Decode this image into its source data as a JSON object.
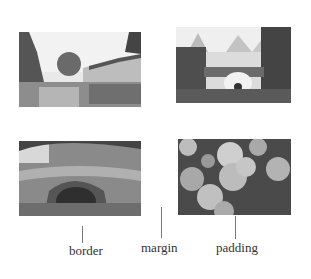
{
  "photos": [
    {
      "name": "village-river-photo",
      "subject": "riverside village houses with tree reflection"
    },
    {
      "name": "stone-bridge-karst-photo",
      "subject": "arched stone bridge with karst mountains"
    },
    {
      "name": "mossy-stone-bridge-photo",
      "subject": "overgrown old stone bridge under trees"
    },
    {
      "name": "oranges-on-tree-photo",
      "subject": "cluster of oranges on tree branch"
    }
  ],
  "labels": {
    "border": "border",
    "margin": "margin",
    "padding": "padding"
  },
  "colors": {
    "background": "#ffffff",
    "leader_line": "#777777",
    "label_text": "#333333"
  }
}
